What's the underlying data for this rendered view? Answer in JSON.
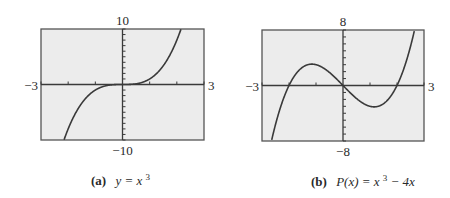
{
  "chart_data": [
    {
      "type": "line",
      "id": "a",
      "function": "x^3",
      "caption_prefix": "(a)",
      "caption_expr": "y = x",
      "caption_sup": "3",
      "caption_tail": "",
      "xlim": [
        -3,
        3
      ],
      "ylim": [
        -10,
        10
      ],
      "x_tick_step": 1,
      "y_tick_step": 1,
      "labels": {
        "xmin": "−3",
        "xmax": "3",
        "ymin": "−10",
        "ymax": "10"
      },
      "series": [
        {
          "name": "y = x^3",
          "coefficients": [
            1,
            0,
            0,
            0
          ]
        }
      ],
      "grid": false,
      "background": "#ececec",
      "line_color": "#3a3a3a"
    },
    {
      "type": "line",
      "id": "b",
      "function": "x^3 - 4x",
      "caption_prefix": "(b)",
      "caption_expr": "P(x) = x",
      "caption_sup": "3",
      "caption_tail": " − 4x",
      "xlim": [
        -3,
        3
      ],
      "ylim": [
        -8,
        8
      ],
      "x_tick_step": 1,
      "y_tick_step": 1,
      "labels": {
        "xmin": "−3",
        "xmax": "3",
        "ymin": "−8",
        "ymax": "8"
      },
      "series": [
        {
          "name": "P(x) = x^3 - 4x",
          "coefficients": [
            1,
            0,
            -4,
            0
          ]
        }
      ],
      "grid": false,
      "background": "#ececec",
      "line_color": "#3a3a3a"
    }
  ]
}
